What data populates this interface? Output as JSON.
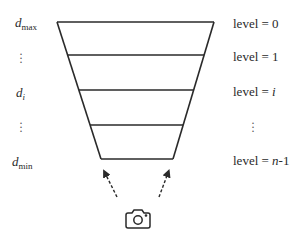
{
  "diagram": {
    "type": "depth-level pyramid / frustum",
    "left_labels": [
      {
        "var": "d",
        "sub": "max"
      },
      {
        "var": "⋮",
        "sub": ""
      },
      {
        "var": "d",
        "sub": "i"
      },
      {
        "var": "⋮",
        "sub": ""
      },
      {
        "var": "d",
        "sub": "min"
      }
    ],
    "right_labels": [
      {
        "prefix": "level = ",
        "value": "0"
      },
      {
        "prefix": "level = ",
        "value": "1"
      },
      {
        "prefix": "level = ",
        "value": "i"
      },
      {
        "prefix": "",
        "value": "⋮"
      },
      {
        "prefix": "level = ",
        "value": "n",
        "suffix": "-1"
      }
    ],
    "camera_icon": "camera-icon",
    "arrows": 2,
    "colors": {
      "stroke": "#2a2a2a",
      "background": "#ffffff"
    }
  }
}
